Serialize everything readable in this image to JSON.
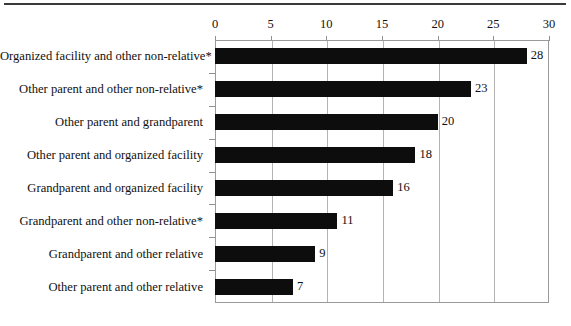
{
  "chart_data": {
    "type": "bar",
    "orientation": "horizontal",
    "title": "",
    "subtitle": "",
    "xlabel": "",
    "ylabel": "",
    "xlim": [
      0,
      30
    ],
    "xticks": [
      0,
      5,
      10,
      15,
      20,
      25,
      30
    ],
    "xtick_labels": [
      "0",
      "5",
      "10",
      "15",
      "20",
      "25",
      "30"
    ],
    "grid": "vertical",
    "legend": "none",
    "bar_color": "#0d0d0d",
    "gridline_color": "#b3b3b3",
    "frame_color": "#9a9a9a",
    "footnote_marker": "*",
    "categories": [
      "Organized facility and other non-relative*",
      "Other parent and other non-relative*",
      "Other parent and grandparent",
      "Other parent and organized facility",
      "Grandparent and organized facility",
      "Grandparent and other non-relative*",
      "Grandparent and other relative",
      "Other parent and other relative"
    ],
    "values": [
      28,
      23,
      20,
      18,
      16,
      11,
      9,
      7
    ],
    "value_labels": [
      "28",
      "23",
      "20",
      "18",
      "16",
      "11",
      "9",
      "7"
    ]
  }
}
